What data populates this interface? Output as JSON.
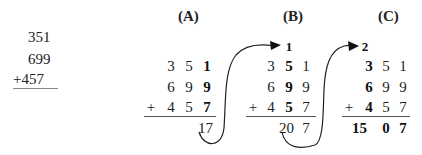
{
  "problem": {
    "rows": [
      "351",
      "699",
      "+457"
    ]
  },
  "panels": [
    {
      "label": "(A)",
      "carry": "",
      "rows": [
        [
          "3",
          "5",
          "1"
        ],
        [
          "6",
          "9",
          "9"
        ],
        [
          "4",
          "5",
          "7"
        ]
      ],
      "plus": "+",
      "result": "17",
      "bold_column": 2
    },
    {
      "label": "(B)",
      "carry": "1",
      "rows": [
        [
          "3",
          "5",
          "1"
        ],
        [
          "6",
          "9",
          "9"
        ],
        [
          "4",
          "5",
          "7"
        ]
      ],
      "plus": "+",
      "result_a": "20",
      "result_b": "7",
      "bold_column": 1
    },
    {
      "label": "(C)",
      "carry": "2",
      "rows": [
        [
          "3",
          "5",
          "1"
        ],
        [
          "6",
          "9",
          "9"
        ],
        [
          "4",
          "5",
          "7"
        ]
      ],
      "plus": "+",
      "result_a": "15",
      "result_b": "0",
      "result_c": "7",
      "bold_column": 0
    }
  ]
}
